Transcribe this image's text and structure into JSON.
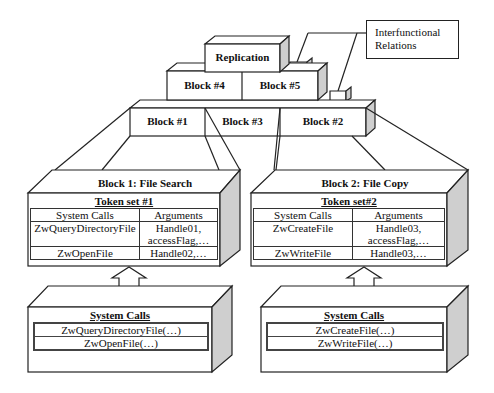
{
  "legend": {
    "line1": "Interfunctional",
    "line2": "Relations"
  },
  "pyramid": {
    "top": {
      "label": "Replication"
    },
    "middle": [
      {
        "label": "Block #4"
      },
      {
        "label": "Block #5"
      }
    ],
    "bottom": [
      {
        "label": "Block #1"
      },
      {
        "label": "Block #3"
      },
      {
        "label": "Block #2"
      }
    ]
  },
  "blocks": [
    {
      "title": "Block 1: File Search",
      "token_set": "Token set #1",
      "columns": [
        "System Calls",
        "Arguments"
      ],
      "rows": [
        {
          "call": "ZwQueryDirectoryFile",
          "args_line1": "Handle01,",
          "args_line2": "accessFlag,…"
        },
        {
          "call": "ZwOpenFile",
          "args_line1": "Handle02,…",
          "args_line2": ""
        }
      ],
      "system_calls_title": "System Calls",
      "system_calls": [
        "ZwQueryDirectoryFile(…)",
        "ZwOpenFile(…)"
      ]
    },
    {
      "title": "Block 2: File Copy",
      "token_set": "Token set#2",
      "columns": [
        "System Calls",
        "Arguments"
      ],
      "rows": [
        {
          "call": "ZwCreateFile",
          "args_line1": "Handle03,",
          "args_line2": "accessFlag,…"
        },
        {
          "call": "ZwWriteFile",
          "args_line1": "Handle03,…",
          "args_line2": ""
        }
      ],
      "system_calls_title": "System Calls",
      "system_calls": [
        "ZwCreateFile(…)",
        "ZwWriteFile(…)"
      ]
    }
  ],
  "colors": {
    "line": "#222222",
    "side_face": "#cfcfcf",
    "face": "#ffffff"
  }
}
